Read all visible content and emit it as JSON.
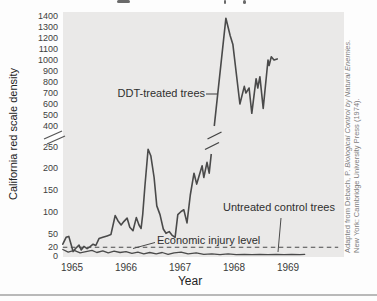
{
  "page": {
    "citation_plain": "Adapted from Debach, P. ",
    "citation_italic": "Biological Control by Natural Enemies.",
    "citation_line2": "New York: Cambridge University Press (1974)."
  },
  "chart_data": {
    "type": "line",
    "title": "",
    "xlabel": "Year",
    "ylabel": "California red scale density",
    "x_years": [
      1965,
      1966,
      1967,
      1968,
      1969
    ],
    "yticks_lower": [
      0,
      20,
      50,
      100,
      150,
      200,
      250
    ],
    "yticks_upper": [
      400,
      500,
      600,
      700,
      800,
      900,
      1000,
      1100,
      1200,
      1300,
      1400
    ],
    "axis_break": {
      "lower_range": [
        0,
        250
      ],
      "upper_range": [
        400,
        1400
      ]
    },
    "economic_injury_level": 20,
    "line_color": "#4a4a4a",
    "annotations": {
      "ddt_label": "DDT-treated trees",
      "untreated_label": "Untreated control trees",
      "econ_label": "Economic injury level"
    },
    "series": [
      {
        "name": "DDT-treated trees",
        "points": [
          [
            1964.83,
            27
          ],
          [
            1964.89,
            43
          ],
          [
            1964.94,
            45
          ],
          [
            1964.98,
            28
          ],
          [
            1965.02,
            10
          ],
          [
            1965.07,
            18
          ],
          [
            1965.13,
            25
          ],
          [
            1965.17,
            14
          ],
          [
            1965.22,
            22
          ],
          [
            1965.28,
            17
          ],
          [
            1965.33,
            21
          ],
          [
            1965.39,
            27
          ],
          [
            1965.44,
            24
          ],
          [
            1965.5,
            40
          ],
          [
            1965.57,
            43
          ],
          [
            1965.65,
            46
          ],
          [
            1965.72,
            49
          ],
          [
            1965.8,
            93
          ],
          [
            1965.85,
            81
          ],
          [
            1965.91,
            71
          ],
          [
            1965.96,
            79
          ],
          [
            1966.02,
            87
          ],
          [
            1966.07,
            66
          ],
          [
            1966.13,
            58
          ],
          [
            1966.19,
            88
          ],
          [
            1966.24,
            71
          ],
          [
            1966.28,
            63
          ],
          [
            1966.31,
            95
          ],
          [
            1966.35,
            160
          ],
          [
            1966.41,
            245
          ],
          [
            1966.46,
            230
          ],
          [
            1966.52,
            180
          ],
          [
            1966.57,
            115
          ],
          [
            1966.63,
            95
          ],
          [
            1966.69,
            62
          ],
          [
            1966.74,
            52
          ],
          [
            1966.8,
            56
          ],
          [
            1966.85,
            48
          ],
          [
            1966.91,
            43
          ],
          [
            1966.96,
            95
          ],
          [
            1967.02,
            102
          ],
          [
            1967.07,
            106
          ],
          [
            1967.13,
            76
          ],
          [
            1967.19,
            140
          ],
          [
            1967.26,
            190
          ],
          [
            1967.31,
            165
          ],
          [
            1967.41,
            207
          ],
          [
            1967.44,
            180
          ],
          [
            1967.5,
            215
          ],
          [
            1967.54,
            190
          ],
          [
            1967.85,
            1380
          ],
          [
            1967.93,
            1220
          ],
          [
            1967.98,
            1140
          ],
          [
            1968.11,
            600
          ],
          [
            1968.19,
            760
          ],
          [
            1968.22,
            700
          ],
          [
            1968.28,
            745
          ],
          [
            1968.33,
            515
          ],
          [
            1968.41,
            830
          ],
          [
            1968.44,
            745
          ],
          [
            1968.48,
            848
          ],
          [
            1968.54,
            560
          ],
          [
            1968.63,
            1000
          ],
          [
            1968.65,
            950
          ],
          [
            1968.69,
            1030
          ],
          [
            1968.74,
            1000
          ],
          [
            1968.8,
            1010
          ]
        ]
      },
      {
        "name": "Untreated control trees",
        "points": [
          [
            1964.83,
            15
          ],
          [
            1964.93,
            9
          ],
          [
            1965.04,
            13
          ],
          [
            1965.15,
            7
          ],
          [
            1965.26,
            10
          ],
          [
            1965.37,
            13
          ],
          [
            1965.46,
            8
          ],
          [
            1965.57,
            12
          ],
          [
            1965.67,
            7
          ],
          [
            1965.78,
            11
          ],
          [
            1965.89,
            8
          ],
          [
            1966.0,
            10
          ],
          [
            1966.11,
            6
          ],
          [
            1966.22,
            9
          ],
          [
            1966.33,
            5
          ],
          [
            1966.44,
            8
          ],
          [
            1966.56,
            5
          ],
          [
            1966.67,
            8
          ],
          [
            1966.78,
            4
          ],
          [
            1966.89,
            7
          ],
          [
            1967.02,
            9
          ],
          [
            1967.15,
            5
          ],
          [
            1967.3,
            7
          ],
          [
            1967.44,
            4
          ],
          [
            1967.59,
            5
          ],
          [
            1967.74,
            3
          ],
          [
            1967.89,
            5
          ],
          [
            1968.04,
            3
          ],
          [
            1968.19,
            4
          ],
          [
            1968.33,
            3
          ],
          [
            1968.48,
            4
          ],
          [
            1968.63,
            3
          ],
          [
            1968.78,
            4
          ],
          [
            1968.93,
            3
          ],
          [
            1969.07,
            4
          ],
          [
            1969.22,
            3
          ],
          [
            1969.31,
            4
          ]
        ]
      }
    ]
  }
}
